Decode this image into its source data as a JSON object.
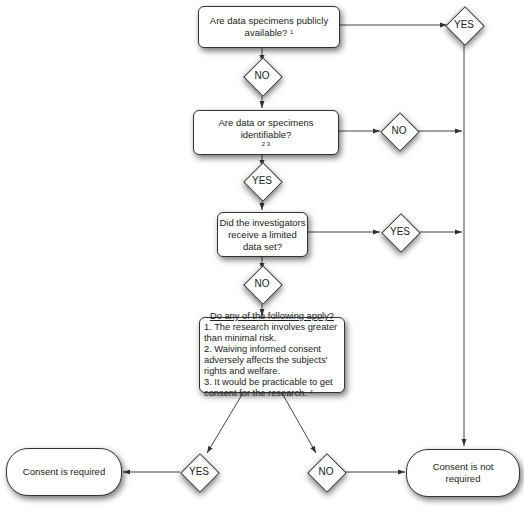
{
  "diagram": {
    "type": "flowchart",
    "nodes": {
      "q1": {
        "text": "Are data specimens publicly available?",
        "footnote": "1"
      },
      "q2": {
        "text": "Are data or specimens identifiable?",
        "footnote": "2 3"
      },
      "q3": {
        "text": "Did the investigators receive a limited data set?"
      },
      "q4": {
        "heading": "Do any of the following apply?",
        "items": [
          "1. The research involves greater than minimal risk.",
          "2. Waiving informed consent adversely affects the subjects' rights and welfare.",
          "3. It would be practicable to get consent for the research."
        ],
        "footnote": "4"
      },
      "outcome_required": {
        "text": "Consent is required"
      },
      "outcome_not_required": {
        "text": "Consent is not required"
      }
    },
    "decisions": {
      "q1_yes": "YES",
      "q1_no": "NO",
      "q2_no": "NO",
      "q2_yes": "YES",
      "q3_yes": "YES",
      "q3_no": "NO",
      "q4_yes": "YES",
      "q4_no": "NO"
    },
    "colors": {
      "line": "#333333",
      "fill": "#ffffff",
      "background": "#ffffff"
    }
  }
}
